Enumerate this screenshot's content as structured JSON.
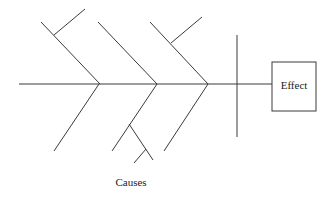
{
  "diagram": {
    "type": "fishbone",
    "effect_label": "Effect",
    "causes_label": "Causes",
    "line_color": "#3a3a3a",
    "background": "#ffffff"
  }
}
